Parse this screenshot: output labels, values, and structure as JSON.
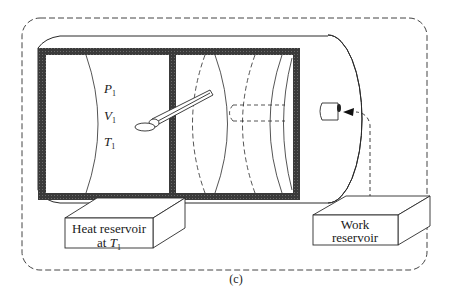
{
  "figure": {
    "caption": "(c)",
    "system_boundary": "dashed-rounded-rectangle",
    "cylinder": {
      "left_chamber": {
        "state_labels": [
          {
            "symbol": "P",
            "subscript": "1"
          },
          {
            "symbol": "V",
            "subscript": "1"
          },
          {
            "symbol": "T",
            "subscript": "1"
          }
        ]
      },
      "right_chamber": {
        "contents": "piston with rod (dashed)"
      }
    },
    "heat_reservoir": {
      "line1": "Heat reservoir",
      "line2_prefix": "at ",
      "line2_symbol": "T",
      "line2_subscript": "1"
    },
    "work_reservoir": {
      "line1": "Work",
      "line2": "reservoir"
    },
    "colors": {
      "wall": "#3a3a3a",
      "line": "#2a2a2a",
      "background": "#ffffff"
    }
  }
}
